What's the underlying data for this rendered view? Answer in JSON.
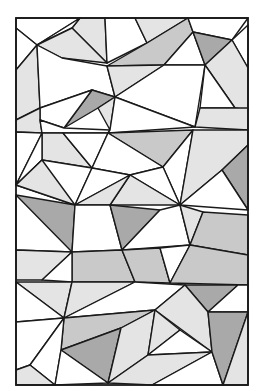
{
  "image": {
    "width": 259,
    "height": 391,
    "background": "#ffffff",
    "stroke": "#1a1a1a",
    "stroke_width": 1.4,
    "frame": {
      "x": 16,
      "y": 18,
      "w": 232,
      "h": 367
    },
    "colors": {
      "w": "#ffffff",
      "l": "#e4e4e4",
      "m": "#c9c9c9",
      "d": "#a9a9a9"
    },
    "polygons": [
      {
        "f": "w",
        "p": "16,18 80,18 37,45 16,28"
      },
      {
        "f": "l",
        "p": "80,18 105,18 107,63 72,28"
      },
      {
        "f": "w",
        "p": "80,18 72,28 37,45"
      },
      {
        "f": "l",
        "p": "72,28 107,63 62,58 37,45"
      },
      {
        "f": "w",
        "p": "105,18 135,18 147,43 107,63"
      },
      {
        "f": "l",
        "p": "135,18 188,18 147,43"
      },
      {
        "f": "m",
        "p": "188,18 193,32 164,65 107,66 147,43"
      },
      {
        "f": "w",
        "p": "193,32 205,65 164,65"
      },
      {
        "f": "w",
        "p": "188,18 248,18 232,40 193,32"
      },
      {
        "f": "d",
        "p": "193,32 232,40 205,65"
      },
      {
        "f": "w",
        "p": "232,40 248,25 248,68"
      },
      {
        "f": "l",
        "p": "232,40 248,68 248,110 235,108 205,65"
      },
      {
        "f": "w",
        "p": "16,28 37,45 16,70"
      },
      {
        "f": "l",
        "p": "16,70 37,45 40,108 16,120"
      },
      {
        "f": "w",
        "p": "37,45 62,58 107,66 115,97 92,90 40,108"
      },
      {
        "f": "l",
        "p": "107,66 164,65 115,97"
      },
      {
        "f": "w",
        "p": "164,65 205,65 195,127 115,97"
      },
      {
        "f": "w",
        "p": "205,65 235,108 200,108"
      },
      {
        "f": "l",
        "p": "200,108 248,108 248,130 195,127"
      },
      {
        "f": "d",
        "p": "92,90 115,97 98,108 64,128"
      },
      {
        "f": "l",
        "p": "98,108 115,97 110,130"
      },
      {
        "f": "w",
        "p": "40,108 92,90 64,128 40,120"
      },
      {
        "f": "l",
        "p": "16,120 40,108 40,120 42,133 16,132"
      },
      {
        "f": "w",
        "p": "40,120 64,128 110,130 108,133 42,133"
      },
      {
        "f": "w",
        "p": "110,130 115,97 195,127 108,133"
      },
      {
        "f": "w",
        "p": "16,132 42,133 16,185"
      },
      {
        "f": "l",
        "p": "42,133 63,133 92,168 42,160"
      },
      {
        "f": "w",
        "p": "42,133 42,160 16,185"
      },
      {
        "f": "w",
        "p": "63,133 108,133 92,168"
      },
      {
        "f": "m",
        "p": "108,133 193,130 163,167"
      },
      {
        "f": "w",
        "p": "108,133 163,167 130,175 92,168"
      },
      {
        "f": "w",
        "p": "163,167 193,130 180,205"
      },
      {
        "f": "l",
        "p": "193,130 248,130 248,145 222,170 180,205"
      },
      {
        "f": "d",
        "p": "222,170 248,145 248,210"
      },
      {
        "f": "w",
        "p": "248,210 222,170 180,205"
      },
      {
        "f": "w",
        "p": "42,160 92,168 75,205 16,185"
      },
      {
        "f": "l",
        "p": "16,185 75,205 42,160"
      },
      {
        "f": "w",
        "p": "92,168 130,175 75,205"
      },
      {
        "f": "w",
        "p": "130,175 163,167 180,205"
      },
      {
        "f": "l",
        "p": "130,175 180,205 110,205"
      },
      {
        "f": "l",
        "p": "75,205 130,175 110,205"
      },
      {
        "f": "d",
        "p": "16,195 75,205 72,252 16,250"
      },
      {
        "f": "w",
        "p": "16,195 16,250 72,252"
      },
      {
        "f": "w",
        "p": "75,205 110,205 122,250 72,252"
      },
      {
        "f": "d",
        "p": "110,205 160,210 122,250"
      },
      {
        "f": "w",
        "p": "122,250 160,210 180,205 190,245"
      },
      {
        "f": "l",
        "p": "180,205 203,212 190,245"
      },
      {
        "f": "m",
        "p": "203,212 248,215 248,255 190,245"
      },
      {
        "f": "l",
        "p": "16,250 72,252 42,280 16,280"
      },
      {
        "f": "m",
        "p": "72,252 122,250 135,282 72,282"
      },
      {
        "f": "w",
        "p": "72,252 72,282 42,280"
      },
      {
        "f": "m",
        "p": "122,250 160,248 170,283 135,282"
      },
      {
        "f": "w",
        "p": "160,248 190,245 170,283"
      },
      {
        "f": "m",
        "p": "190,245 248,255 248,285 170,283"
      },
      {
        "f": "l",
        "p": "16,282 72,282 64,318"
      },
      {
        "f": "w",
        "p": "16,282 64,318 16,322"
      },
      {
        "f": "l",
        "p": "72,282 135,282 64,318"
      },
      {
        "f": "w",
        "p": "135,282 185,285 155,310 64,318"
      },
      {
        "f": "d",
        "p": "185,285 238,285 208,312"
      },
      {
        "f": "w",
        "p": "208,312 238,285 248,285 248,312"
      },
      {
        "f": "l",
        "p": "155,310 185,285 208,312 212,352"
      },
      {
        "f": "w",
        "p": "16,322 64,318 30,365 16,370"
      },
      {
        "f": "m",
        "p": "64,318 155,310 121,328 61,350"
      },
      {
        "f": "d",
        "p": "61,350 121,328 108,383"
      },
      {
        "f": "w",
        "p": "64,318 61,350 55,385 30,365"
      },
      {
        "f": "l",
        "p": "16,370 30,365 55,385 16,385"
      },
      {
        "f": "w",
        "p": "61,350 108,383 55,385"
      },
      {
        "f": "l",
        "p": "121,328 155,310 148,355 108,383"
      },
      {
        "f": "l",
        "p": "155,310 180,330 148,355"
      },
      {
        "f": "w",
        "p": "180,330 212,352 148,355"
      },
      {
        "f": "l",
        "p": "148,355 212,352 152,385 108,383"
      },
      {
        "f": "w",
        "p": "212,352 223,385 152,385"
      },
      {
        "f": "d",
        "p": "208,312 248,312 223,385 212,352"
      },
      {
        "f": "l",
        "p": "248,312 248,385 223,385"
      }
    ]
  }
}
